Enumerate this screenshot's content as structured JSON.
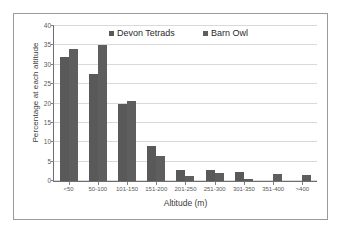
{
  "chart_data": {
    "type": "bar",
    "title": "",
    "xlabel": "Altitude (m)",
    "ylabel": "Percentage at each altitude",
    "categories": [
      "<50",
      "50-100",
      "101-150",
      "151-200",
      "201-250",
      "251-300",
      "301-350",
      "351-400",
      ">400"
    ],
    "series": [
      {
        "name": "Devon Tetrads",
        "color": "#595959",
        "values": [
          31.9,
          27.6,
          20.0,
          9.0,
          2.9,
          2.9,
          2.4,
          0,
          0
        ]
      },
      {
        "name": "Barn Owl",
        "color": "#5e5e5e",
        "values": [
          34.0,
          35.0,
          20.7,
          6.5,
          1.4,
          2.0,
          0.5,
          1.9,
          1.6
        ]
      }
    ],
    "ylim": [
      0,
      40
    ],
    "yticks": [
      0,
      5,
      10,
      15,
      20,
      25,
      30,
      35,
      40
    ],
    "ytick_labels": [
      "0",
      "5",
      "10",
      "15",
      "20",
      "25",
      "30",
      "35",
      "40"
    ],
    "grid": true,
    "legend_position": "top-center"
  },
  "legend": {
    "entries": [
      {
        "label": "Devon Tetrads"
      },
      {
        "label": "Barn Owl"
      }
    ]
  },
  "colors": {
    "bar_fill": "#595959",
    "gridline": "#d9d9d9",
    "axis": "#6e6e6e",
    "frame": "#9a9a9a",
    "background": "#ffffff"
  }
}
